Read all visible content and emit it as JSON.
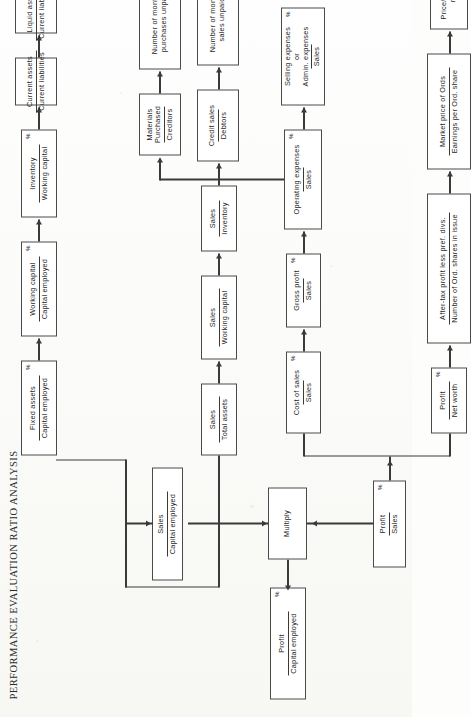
{
  "document": {
    "title": "PERFORMANCE EVALUATION RATIO ANALYSIS",
    "type": "flowchart",
    "orientation": "landscape-rotated-90",
    "line_color": "#3a3a3a",
    "box_border_color": "#4a4a4a",
    "background_color": "#fdfdfb"
  },
  "nodes": {
    "profit_capital_employed": {
      "num": "Profit",
      "den": "Capital employed",
      "pct": "%"
    },
    "multiply": {
      "plain": "Multiply"
    },
    "sales_capital_employed": {
      "num": "Sales",
      "den": "Capital employed"
    },
    "profit_sales": {
      "num": "Profit",
      "den": "Sales",
      "pct": "%"
    },
    "fixed_assets_capital": {
      "num": "Fixed assets",
      "den": "Capital employed",
      "pct": "%"
    },
    "working_capital_capital": {
      "num": "Working capital",
      "den": "Capital employed",
      "pct": "%"
    },
    "inventory_working": {
      "num": "Inventory",
      "den": "Working capital",
      "pct": "%"
    },
    "current_assets_liab": {
      "num": "Current assets",
      "den": "Current liabilities"
    },
    "liquid_assets_liab": {
      "num": "Liquid assets",
      "den": "Current liabilities"
    },
    "sales_total_assets": {
      "num": "Sales",
      "den": "Total assets"
    },
    "sales_working_capital": {
      "num": "Sales",
      "den": "Working capital"
    },
    "sales_inventory": {
      "num": "Sales",
      "den": "Inventory"
    },
    "credit_sales_debtors": {
      "num": "Credit sales",
      "den": "Debtors"
    },
    "months_sales_unpaid": {
      "l1": "Number of months'",
      "l2": "sales unpaid"
    },
    "cost_of_sales_sales": {
      "num": "Cost of sales",
      "den": "Sales",
      "pct": "%"
    },
    "gross_profit_sales": {
      "num": "Gross profit",
      "den": "Sales",
      "pct": "%"
    },
    "operating_expenses_sales": {
      "num": "Operating expenses",
      "den": "Sales",
      "pct": "%"
    },
    "selling_admin_sales": {
      "n1": "Selling expenses",
      "n2": "or",
      "n3": "Admin. expenses",
      "den": "Sales",
      "pct": "%"
    },
    "materials_purchased_creditors": {
      "n1": "Materials",
      "n2": "Purchased",
      "den": "Creditors"
    },
    "months_purchases_unpaid": {
      "l1": "Number of months'",
      "l2": "purchases unpaid"
    },
    "profit_net_worth": {
      "num": "Profit",
      "den": "Net worth",
      "pct": "%"
    },
    "eps": {
      "num": "After-tax profit less pref. divs.",
      "den": "Number of Ord. shares in issue"
    },
    "pe": {
      "num": "Market price of Ords",
      "den": "Earnings per Ord. share"
    },
    "price_earnings_ratio": {
      "l1": "Price/earnings",
      "l2": "ratio"
    }
  }
}
